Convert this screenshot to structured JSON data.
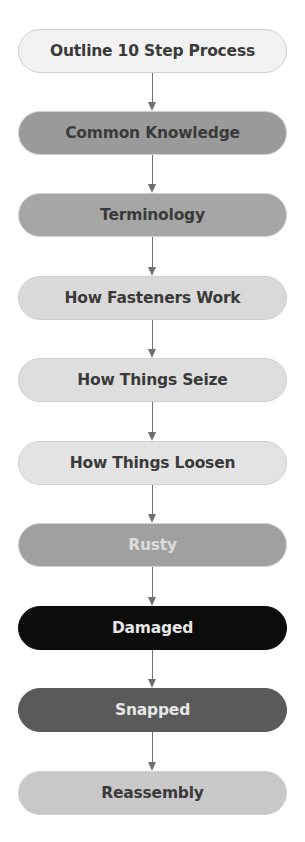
{
  "diagram": {
    "type": "vertical-flowchart",
    "steps": [
      {
        "label": "Outline 10 Step Process",
        "fill": "#f2f2f2",
        "text_color": "#3a3a3a"
      },
      {
        "label": "Common Knowledge",
        "fill": "#9a9a9a",
        "text_color": "#3a3a3a"
      },
      {
        "label": "Terminology",
        "fill": "#a6a6a6",
        "text_color": "#3a3a3a"
      },
      {
        "label": "How Fasteners Work",
        "fill": "#d9d9d9",
        "text_color": "#3a3a3a"
      },
      {
        "label": "How Things Seize",
        "fill": "#dedede",
        "text_color": "#3a3a3a"
      },
      {
        "label": "How Things Loosen",
        "fill": "#e3e3e3",
        "text_color": "#3a3a3a"
      },
      {
        "label": "Rusty",
        "fill": "#a0a0a0",
        "text_color": "#dcdcdc"
      },
      {
        "label": "Damaged",
        "fill": "#0c0c0c",
        "text_color": "#e6e6e6"
      },
      {
        "label": "Snapped",
        "fill": "#5a5a5a",
        "text_color": "#e6e6e6"
      },
      {
        "label": "Reassembly",
        "fill": "#c8c8c8",
        "text_color": "#3a3a3a"
      }
    ],
    "connector_color": "#707070"
  }
}
